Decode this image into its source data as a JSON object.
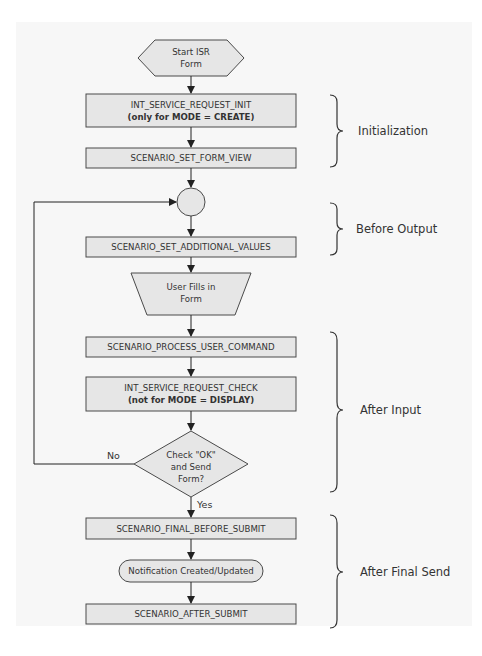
{
  "colors": {
    "box_fill": "#e6e6e6",
    "stroke": "#4a4a4a",
    "background": "#f7f7f7"
  },
  "nodes": {
    "start": {
      "line1": "Start  ISR",
      "line2": "Form"
    },
    "init": {
      "line1": "INT_SERVICE_REQUEST_INIT",
      "line2": "(only for MODE = CREATE)"
    },
    "form_view": {
      "label": "SCENARIO_SET_FORM_VIEW"
    },
    "additional_values": {
      "label": "SCENARIO_SET_ADDITIONAL_VALUES"
    },
    "user_fills": {
      "line1": "User Fills in",
      "line2": "Form"
    },
    "process_command": {
      "label": "SCENARIO_PROCESS_USER_COMMAND"
    },
    "check": {
      "line1": "INT_SERVICE_REQUEST_CHECK",
      "line2": "(not for MODE = DISPLAY)"
    },
    "decision": {
      "line1": "Check \"OK\"",
      "line2": "and Send",
      "line3": "Form?"
    },
    "final_before_submit": {
      "label": "SCENARIO_FINAL_BEFORE_SUBMIT"
    },
    "notification": {
      "label": "Notification Created/Updated"
    },
    "after_submit": {
      "label": "SCENARIO_AFTER_SUBMIT"
    }
  },
  "edges": {
    "no_label": "No",
    "yes_label": "Yes"
  },
  "phases": [
    {
      "label": "Initialization"
    },
    {
      "label": "Before Output"
    },
    {
      "label": "After Input"
    },
    {
      "label": "After Final Send"
    }
  ]
}
